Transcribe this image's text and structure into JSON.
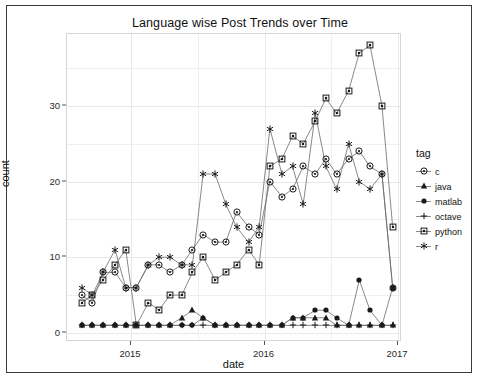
{
  "chart_data": {
    "type": "line",
    "title": "Language wise Post Trends over Time",
    "xlabel": "date",
    "ylabel": "count",
    "legend_title": "tag",
    "legend_position": "right",
    "grid": true,
    "xlim": [
      2014.52,
      2017.03
    ],
    "ylim": [
      -1.2,
      39.5
    ],
    "xticks": [
      2015,
      2016,
      2017
    ],
    "xtick_labels": [
      "2015",
      "2016",
      "2017"
    ],
    "yticks": [
      0,
      10,
      20,
      30
    ],
    "ytick_labels": [
      "0",
      "10",
      "20",
      "30"
    ],
    "marker_shapes": {
      "c": "circle-dot",
      "java": "triangle",
      "matlab": "filled-circle",
      "octave": "plus",
      "python": "square",
      "r": "asterisk"
    },
    "series": [
      {
        "name": "c",
        "marker": "circle-dot",
        "x": [
          2014.63,
          2014.71,
          2014.79,
          2014.88,
          2014.96,
          2015.04,
          2015.13,
          2015.21,
          2015.29,
          2015.38,
          2015.46,
          2015.54,
          2015.63,
          2015.71,
          2015.79,
          2015.88,
          2015.96,
          2016.04,
          2016.13,
          2016.21,
          2016.29,
          2016.38,
          2016.46,
          2016.54,
          2016.63,
          2016.71,
          2016.79,
          2016.88,
          2016.96
        ],
        "y": [
          5,
          4,
          8,
          8,
          6,
          6,
          9,
          9,
          8,
          9,
          11,
          13,
          12,
          12,
          16,
          14,
          13,
          20,
          18,
          19,
          22,
          21,
          23,
          21,
          23,
          24,
          22,
          21,
          6
        ]
      },
      {
        "name": "java",
        "marker": "triangle",
        "x": [
          2014.63,
          2014.71,
          2014.79,
          2014.88,
          2014.96,
          2015.04,
          2015.13,
          2015.21,
          2015.29,
          2015.38,
          2015.46,
          2015.54,
          2015.63,
          2015.71,
          2015.79,
          2015.88,
          2015.96,
          2016.04,
          2016.13,
          2016.21,
          2016.29,
          2016.38,
          2016.46,
          2016.54,
          2016.63,
          2016.71,
          2016.79,
          2016.88,
          2016.96
        ],
        "y": [
          1,
          1,
          1,
          1,
          1,
          1,
          1,
          1,
          1,
          2,
          3,
          2,
          1,
          1,
          1,
          1,
          1,
          1,
          1,
          2,
          2,
          2,
          2,
          1,
          1,
          1,
          1,
          1,
          1
        ]
      },
      {
        "name": "matlab",
        "marker": "filled-circle",
        "x": [
          2014.63,
          2014.71,
          2014.79,
          2014.88,
          2014.96,
          2015.04,
          2015.13,
          2015.21,
          2015.29,
          2015.38,
          2015.46,
          2015.54,
          2015.63,
          2015.71,
          2015.79,
          2015.88,
          2015.96,
          2016.04,
          2016.13,
          2016.21,
          2016.29,
          2016.38,
          2016.46,
          2016.54,
          2016.63,
          2016.71,
          2016.79,
          2016.88,
          2016.96
        ],
        "y": [
          1,
          1,
          1,
          1,
          1,
          1,
          1,
          1,
          1,
          1,
          1,
          2,
          1,
          1,
          1,
          1,
          1,
          1,
          1,
          2,
          2,
          3,
          3,
          2,
          1,
          7,
          3,
          1,
          6
        ]
      },
      {
        "name": "octave",
        "marker": "plus",
        "x": [
          2014.63,
          2014.71,
          2014.79,
          2014.88,
          2014.96,
          2015.04,
          2015.13,
          2015.21,
          2015.29,
          2015.38,
          2015.46,
          2015.54,
          2015.63,
          2015.71,
          2015.79,
          2015.88,
          2015.96,
          2016.04,
          2016.13,
          2016.21,
          2016.29,
          2016.38,
          2016.46,
          2016.54,
          2016.63,
          2016.71,
          2016.79,
          2016.88,
          2016.96
        ],
        "y": [
          1,
          1,
          1,
          1,
          1,
          1,
          1,
          1,
          1,
          1,
          1,
          1,
          1,
          1,
          1,
          1,
          1,
          1,
          1,
          1,
          1,
          1,
          1,
          1,
          1,
          1,
          1,
          1,
          1
        ]
      },
      {
        "name": "python",
        "marker": "square",
        "x": [
          2014.63,
          2014.71,
          2014.79,
          2014.88,
          2014.96,
          2015.04,
          2015.13,
          2015.21,
          2015.29,
          2015.38,
          2015.46,
          2015.54,
          2015.63,
          2015.71,
          2015.79,
          2015.88,
          2015.96,
          2016.04,
          2016.13,
          2016.21,
          2016.29,
          2016.38,
          2016.46,
          2016.54,
          2016.63,
          2016.71,
          2016.79,
          2016.88,
          2016.96
        ],
        "y": [
          4,
          5,
          7,
          9,
          11,
          1,
          4,
          3,
          5,
          5,
          8,
          10,
          7,
          8,
          9,
          11,
          9,
          22,
          23,
          26,
          25,
          28,
          31,
          29,
          32,
          37,
          38,
          30,
          14
        ]
      },
      {
        "name": "r",
        "marker": "asterisk",
        "x": [
          2014.63,
          2014.71,
          2014.79,
          2014.88,
          2014.96,
          2015.04,
          2015.13,
          2015.21,
          2015.29,
          2015.38,
          2015.46,
          2015.54,
          2015.63,
          2015.71,
          2015.79,
          2015.88,
          2015.96,
          2016.04,
          2016.13,
          2016.21,
          2016.29,
          2016.38,
          2016.46,
          2016.54,
          2016.63,
          2016.71,
          2016.79,
          2016.88,
          2016.96
        ],
        "y": [
          6,
          5,
          8,
          11,
          6,
          6,
          9,
          10,
          10,
          9,
          9,
          21,
          21,
          17,
          14,
          12,
          14,
          27,
          21,
          22,
          17,
          29,
          22,
          19,
          25,
          20,
          19,
          21,
          6
        ]
      }
    ]
  },
  "legend": {
    "title": "tag",
    "items": [
      {
        "label": "c",
        "marker": "circle-dot"
      },
      {
        "label": "java",
        "marker": "triangle"
      },
      {
        "label": "matlab",
        "marker": "filled-circle"
      },
      {
        "label": "octave",
        "marker": "plus"
      },
      {
        "label": "python",
        "marker": "square"
      },
      {
        "label": "r",
        "marker": "asterisk"
      }
    ]
  },
  "colors": {
    "line": "#6b6b6b",
    "marker": "#1a1a1a",
    "grid": "#efefef",
    "panel_border": "#d6d6d6",
    "frame": "#3a3a3a",
    "text": "#111111",
    "background": "#ffffff"
  }
}
